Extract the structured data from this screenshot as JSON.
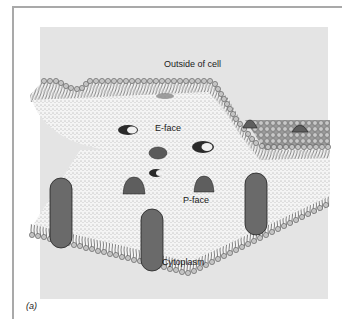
{
  "figure": {
    "panel_label": "(a)",
    "labels": {
      "outside": "Outside of cell",
      "e_face": "E-face",
      "p_face": "P-face",
      "cytoplasm": "Cytoplasm"
    },
    "colors": {
      "background_panel": "#e4e4e4",
      "frame": "#a9a9a9",
      "lipid_head": "#bdbdbd",
      "protein": "#6a6a6a",
      "fracture_face": "#f2f2f2"
    }
  }
}
